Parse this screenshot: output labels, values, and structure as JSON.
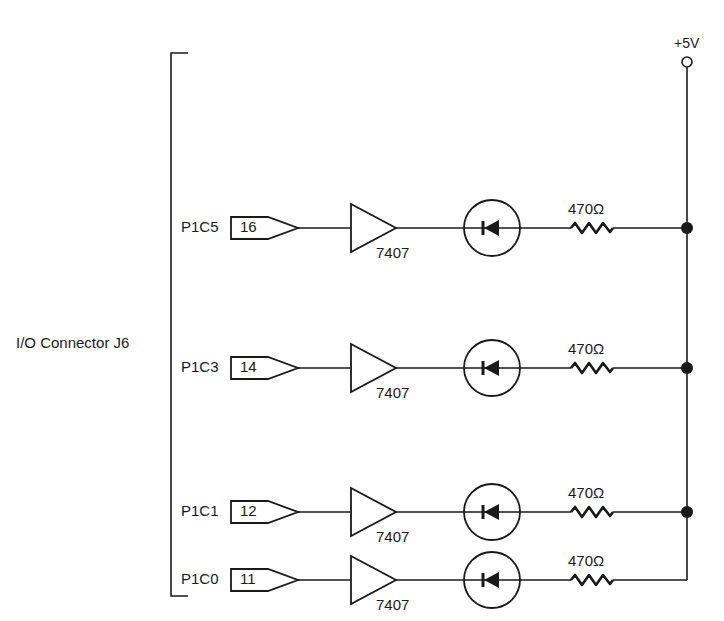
{
  "diagram": {
    "type": "circuit-schematic",
    "connector_label": "I/O Connector J6",
    "supply": {
      "label": "+5V"
    },
    "rows": [
      {
        "signal": "P1C5",
        "pin": "16",
        "buffer": "7407",
        "resistor": "470Ω",
        "y": 228,
        "junction": true
      },
      {
        "signal": "P1C3",
        "pin": "14",
        "buffer": "7407",
        "resistor": "470Ω",
        "y": 368,
        "junction": true
      },
      {
        "signal": "P1C1",
        "pin": "12",
        "buffer": "7407",
        "resistor": "470Ω",
        "y": 512,
        "junction": true
      },
      {
        "signal": "P1C0",
        "pin": "11",
        "buffer": "7407",
        "resistor": "470Ω",
        "y": 580,
        "junction": false
      }
    ],
    "components": {
      "connector_icon": "connector-pin-icon",
      "buffer_icon": "buffer-triangle-icon",
      "led_icon": "led-diode-icon",
      "resistor_icon": "resistor-zigzag-icon",
      "junction_icon": "junction-dot-icon",
      "supply_icon": "supply-terminal-icon"
    }
  }
}
